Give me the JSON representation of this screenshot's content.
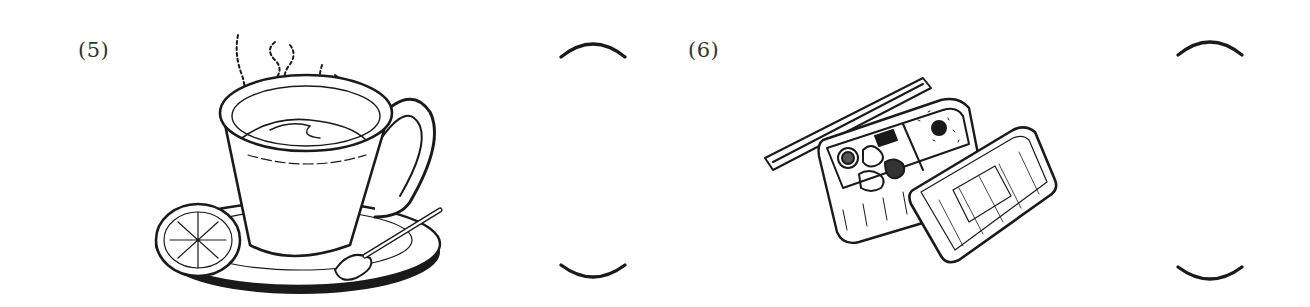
{
  "items": [
    {
      "number": "(5)",
      "illustration": "coffee-cup-with-saucer-lemon-slice-and-spoon",
      "answer_blank": ""
    },
    {
      "number": "(6)",
      "illustration": "bento-lunch-box-with-chopsticks-and-lid",
      "answer_blank": ""
    }
  ],
  "colors": {
    "ink": "#1a1a1a",
    "background": "#ffffff"
  }
}
